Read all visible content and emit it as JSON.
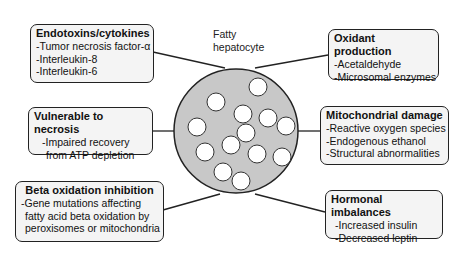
{
  "center": {
    "label_line1": "Fatty",
    "label_line2": "hepatocyte"
  },
  "boxes": {
    "endotoxins": {
      "title": "Endotoxins/cytokines",
      "items": [
        "-Tumor necrosis factor-α",
        "-Interleukin-8",
        "-Interleukin-6"
      ]
    },
    "oxidant": {
      "title": "Oxidant production",
      "items": [
        "-Acetaldehyde",
        "-Microsomal enzymes"
      ]
    },
    "vulnerable": {
      "title": "Vulnerable to necrosis",
      "items": [
        "-Impaired recovery",
        "from ATP depletion"
      ]
    },
    "mitochondrial": {
      "title": "Mitochondrial damage",
      "items": [
        "-Reactive oxygen species",
        "-Endogenous ethanol",
        "-Structural abnormalities"
      ]
    },
    "beta": {
      "title": "Beta oxidation inhibition",
      "items": [
        "-Gene mutations affecting",
        "fatty acid beta oxidation by",
        "peroxisomes or mitochondria"
      ]
    },
    "hormonal": {
      "title": "Hormonal imbalances",
      "items": [
        "-Increased insulin",
        "-Decreased leptin"
      ]
    }
  },
  "colors": {
    "cell_fill": "#c8c8c8",
    "vacuole_fill": "#ffffff",
    "box_fill": "#f4f4f4",
    "stroke": "#222222"
  }
}
